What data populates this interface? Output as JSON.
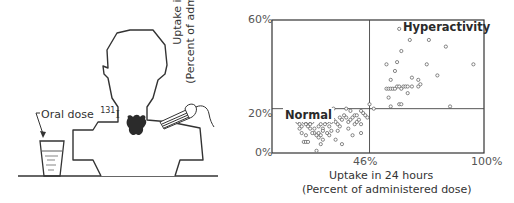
{
  "illustration": {
    "oral_dose_label": "Oral dose",
    "isotope_mass": "131",
    "isotope_symbol": "I",
    "elements": [
      "patient-head-silhouette",
      "thyroid-gland",
      "radiation-detector-probe",
      "drinking-glass",
      "table-surface"
    ]
  },
  "chart_data": {
    "type": "scatter",
    "title": "",
    "xlabel": "Uptake in 24 hours",
    "xlabel_sub": "(Percent of administered dose)",
    "ylabel": "Uptake in 1 hour",
    "ylabel_sub": "(Percent of administered dose)",
    "xlim": [
      0,
      100
    ],
    "ylim": [
      0,
      60
    ],
    "x_ticks": [
      "46%",
      "100%"
    ],
    "y_ticks": [
      "0%",
      "20%",
      "60%"
    ],
    "reference_lines": {
      "x": 46,
      "y": 20
    },
    "grid": false,
    "legend": null,
    "annotations": [
      {
        "text": "Normal",
        "x": 3,
        "y": 20
      },
      {
        "text": "Hyperactivity",
        "x": 62,
        "y": 57
      }
    ],
    "series": [
      {
        "name": "Normal",
        "points": [
          [
            12,
            14
          ],
          [
            13,
            13
          ],
          [
            14,
            12
          ],
          [
            13,
            11
          ],
          [
            15,
            14
          ],
          [
            16,
            13
          ],
          [
            17,
            14
          ],
          [
            18,
            13
          ],
          [
            17,
            12
          ],
          [
            19,
            14
          ],
          [
            14,
            9
          ],
          [
            16,
            8
          ],
          [
            15,
            5
          ],
          [
            16,
            5
          ],
          [
            17,
            5
          ],
          [
            20,
            9
          ],
          [
            21,
            8
          ],
          [
            22,
            9
          ],
          [
            23,
            8
          ],
          [
            20,
            11
          ],
          [
            22,
            12
          ],
          [
            23,
            13
          ],
          [
            24,
            11
          ],
          [
            25,
            13
          ],
          [
            24,
            10
          ],
          [
            26,
            9
          ],
          [
            27,
            8
          ],
          [
            22,
            7
          ],
          [
            23,
            4
          ],
          [
            21,
            1
          ],
          [
            27,
            12
          ],
          [
            28,
            14
          ],
          [
            29,
            15
          ],
          [
            30,
            14
          ],
          [
            31,
            13
          ],
          [
            32,
            16
          ],
          [
            33,
            15
          ],
          [
            34,
            17
          ],
          [
            35,
            16
          ],
          [
            36,
            14
          ],
          [
            37,
            15
          ],
          [
            38,
            16
          ],
          [
            39,
            13
          ],
          [
            40,
            14
          ],
          [
            41,
            15
          ],
          [
            42,
            13
          ],
          [
            43,
            18
          ],
          [
            44,
            17
          ],
          [
            45,
            16
          ],
          [
            42,
            19
          ],
          [
            37,
            19
          ],
          [
            29,
            20
          ],
          [
            26,
            17
          ],
          [
            25,
            15
          ],
          [
            36,
            11
          ],
          [
            42,
            9
          ],
          [
            30,
            6
          ],
          [
            33,
            4
          ],
          [
            38,
            8
          ],
          [
            20,
            15
          ],
          [
            18,
            11
          ],
          [
            24,
            6
          ],
          [
            39,
            17
          ],
          [
            35,
            20
          ],
          [
            28,
            10
          ],
          [
            32,
            12
          ],
          [
            40,
            17
          ],
          [
            26,
            14
          ],
          [
            19,
            9
          ],
          [
            31,
            10
          ]
        ]
      },
      {
        "name": "Hyperactivity",
        "points": [
          [
            46,
            22
          ],
          [
            48,
            20
          ],
          [
            54,
            29
          ],
          [
            55,
            29
          ],
          [
            56,
            29
          ],
          [
            57,
            29
          ],
          [
            58,
            29
          ],
          [
            59,
            30
          ],
          [
            60,
            30
          ],
          [
            61,
            29
          ],
          [
            62,
            30
          ],
          [
            63,
            30
          ],
          [
            64,
            30
          ],
          [
            66,
            30
          ],
          [
            69,
            30
          ],
          [
            70,
            31
          ],
          [
            55,
            25
          ],
          [
            56,
            21
          ],
          [
            60,
            22
          ],
          [
            61,
            22
          ],
          [
            54,
            40
          ],
          [
            56,
            33
          ],
          [
            58,
            37
          ],
          [
            59,
            41
          ],
          [
            61,
            46
          ],
          [
            60,
            56
          ],
          [
            65,
            51
          ],
          [
            66,
            34
          ],
          [
            69,
            33
          ],
          [
            73,
            40
          ],
          [
            74,
            51
          ],
          [
            78,
            35
          ],
          [
            82,
            48
          ],
          [
            84,
            21
          ],
          [
            95,
            40
          ],
          [
            64,
            27
          ]
        ]
      }
    ]
  }
}
